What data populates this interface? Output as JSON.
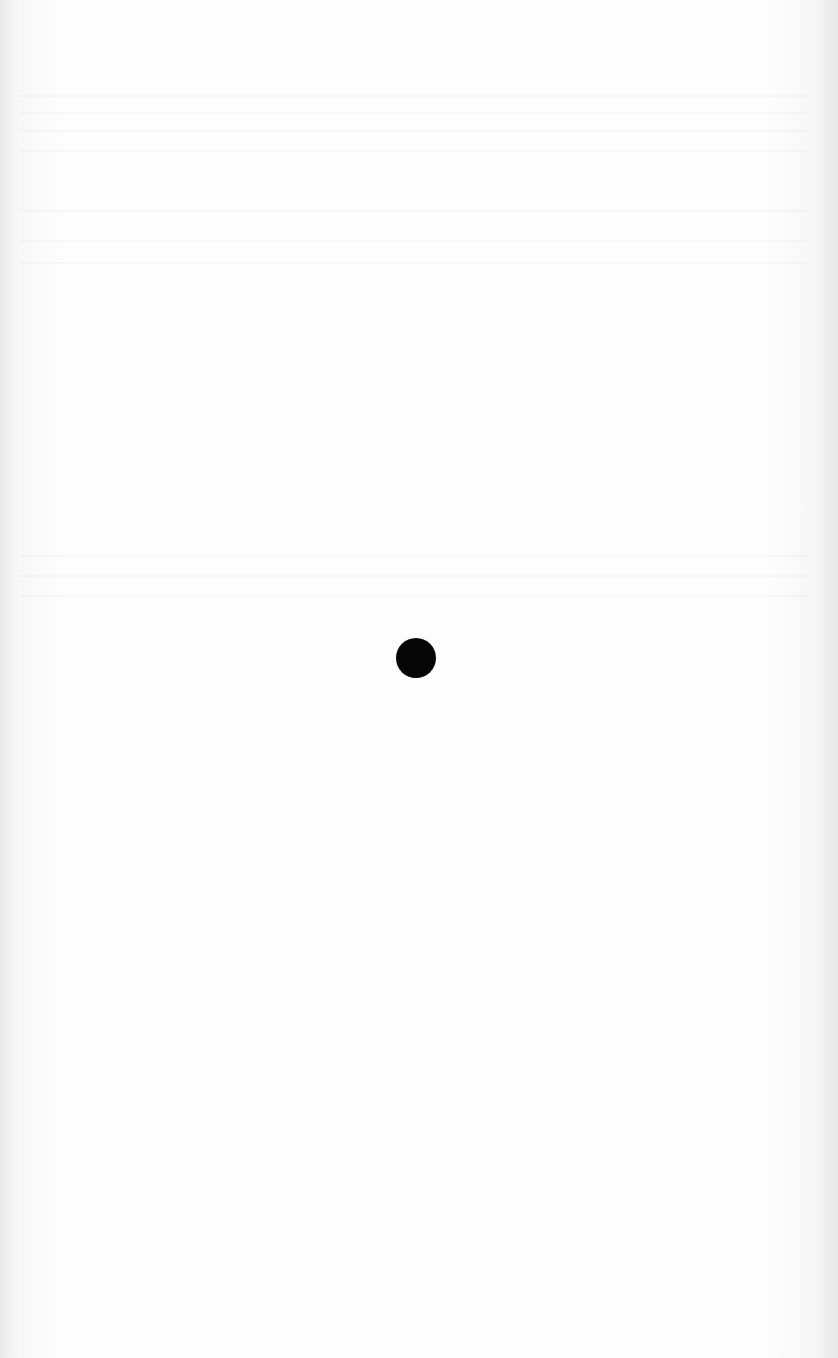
{
  "document": {
    "type": "scanned blank page",
    "marks": [
      {
        "shape": "filled-circle",
        "color": "#050505",
        "center": [
          416,
          658
        ],
        "diameter": 40
      }
    ],
    "background_color": "#fdfdfd"
  }
}
